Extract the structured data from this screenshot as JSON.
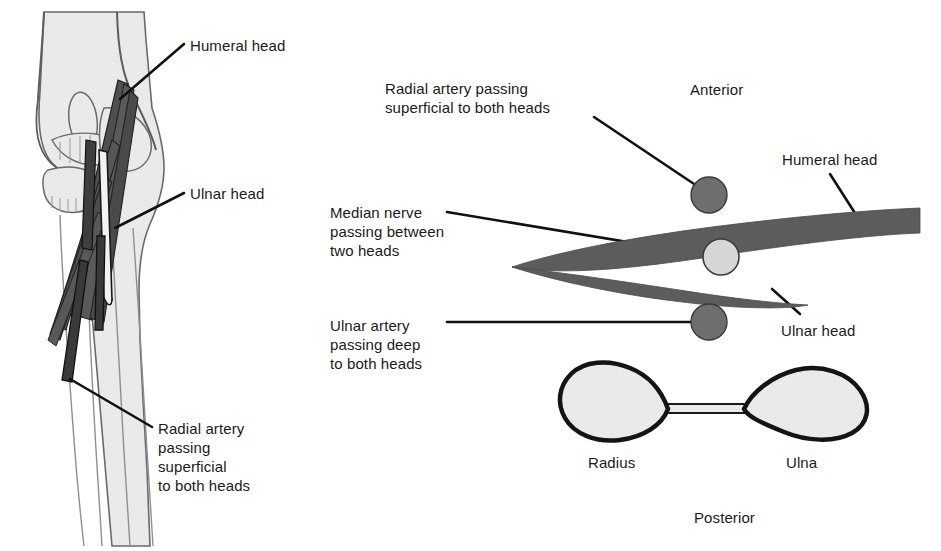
{
  "figure": {
    "background_color": "#ffffff",
    "colors": {
      "muscle_fill": "#5c5c5c",
      "artery_fill": "#6e6e6e",
      "nerve_fill": "#d6d6d6",
      "bone_fill": "#e8e8e8",
      "bone_outline": "#1a1a1a",
      "leader_line": "#111111",
      "text": "#1a1a1a"
    }
  },
  "left_panel": {
    "name": "anterior-elbow-illustration",
    "labels": [
      {
        "id": "humeral-head",
        "text": "Humeral head",
        "x": 190,
        "y": 38
      },
      {
        "id": "ulnar-head",
        "text": "Ulnar head",
        "x": 190,
        "y": 186
      },
      {
        "id": "radial-artery",
        "text": "Radial artery\npassing\nsuperficial\nto both heads",
        "x": 158,
        "y": 419
      }
    ]
  },
  "middle_labels": [
    {
      "id": "radial-artery-superficial",
      "text": "Radial artery passing\nsuperficial to both heads",
      "x": 385,
      "y": 79
    },
    {
      "id": "median-nerve-between",
      "text": "Median nerve\npassing between\ntwo heads",
      "x": 330,
      "y": 203
    },
    {
      "id": "ulnar-artery-deep",
      "text": "Ulnar artery\npassing deep\nto both heads",
      "x": 330,
      "y": 316
    }
  ],
  "right_panel": {
    "name": "cross-section-diagram",
    "orientation": {
      "anterior": "Anterior",
      "posterior": "Posterior"
    },
    "orientation_pos": {
      "anterior": {
        "x": 690,
        "y": 80
      },
      "posterior": {
        "x": 694,
        "y": 508
      }
    },
    "muscle_labels": [
      {
        "id": "humeral-head-right",
        "text": "Humeral head",
        "x": 782,
        "y": 150
      },
      {
        "id": "ulnar-head-right",
        "text": "Ulnar head",
        "x": 781,
        "y": 321
      }
    ],
    "bone_labels": [
      {
        "id": "radius",
        "text": "Radius",
        "x": 588,
        "y": 453
      },
      {
        "id": "ulna",
        "text": "Ulna",
        "x": 786,
        "y": 453
      }
    ],
    "structures": [
      {
        "id": "radial-artery-circle",
        "kind": "artery",
        "cx": 709,
        "cy": 195,
        "r": 18,
        "fill": "#6e6e6e"
      },
      {
        "id": "median-nerve-circle",
        "kind": "nerve",
        "cx": 721,
        "cy": 257,
        "r": 18,
        "fill": "#d6d6d6"
      },
      {
        "id": "ulnar-artery-circle",
        "kind": "artery",
        "cx": 709,
        "cy": 322,
        "r": 18,
        "fill": "#6e6e6e"
      },
      {
        "id": "humeral-head-muscle",
        "kind": "muscle",
        "fill": "#5c5c5c"
      },
      {
        "id": "ulnar-head-muscle",
        "kind": "muscle",
        "fill": "#5c5c5c"
      },
      {
        "id": "radius-bone",
        "kind": "bone",
        "fill": "#e8e8e8"
      },
      {
        "id": "ulna-bone",
        "kind": "bone",
        "fill": "#e8e8e8"
      },
      {
        "id": "interosseous-membrane",
        "kind": "membrane",
        "fill": "#e8e8e8"
      }
    ]
  }
}
